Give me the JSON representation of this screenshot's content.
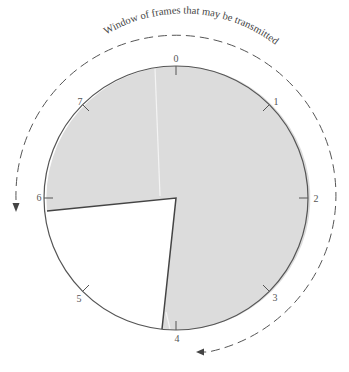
{
  "diagram": {
    "title": "Window of frames that may be transmitted",
    "sequence_numbers": [
      "0",
      "1",
      "2",
      "3",
      "4",
      "5",
      "6",
      "7"
    ],
    "colors": {
      "window_fill": "#dcdcdc",
      "outline": "#555555",
      "arrow": "#666666"
    },
    "window": {
      "from": "4",
      "to": "6",
      "direction": "clockwise, shaded from 4 through 0 to 6"
    }
  }
}
